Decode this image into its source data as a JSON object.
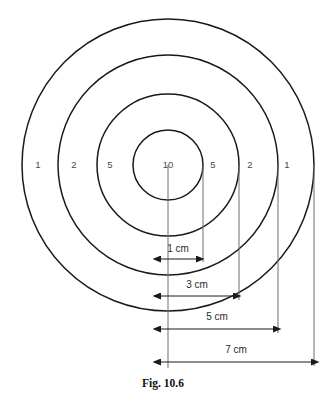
{
  "figure": {
    "caption": "Fig. 10.6",
    "kind": "concentric-circle-target-diagram",
    "center": {
      "x": 168,
      "y": 165
    },
    "rings": [
      {
        "score": "1",
        "radius_px": 146,
        "radius_cm": 7,
        "label_left_x": 38,
        "label_right_x": 287
      },
      {
        "score": "2",
        "radius_px": 110,
        "radius_cm": 5,
        "label_left_x": 74,
        "label_right_x": 250
      },
      {
        "score": "5",
        "radius_px": 71,
        "radius_cm": 3,
        "label_left_x": 110,
        "label_right_x": 213
      },
      {
        "score": "10",
        "radius_px": 35,
        "radius_cm": 1,
        "label_left_x": 168,
        "label_right_x": 168
      }
    ],
    "ring_label_y": 165,
    "ring_labels_left": [
      "1",
      "2",
      "5"
    ],
    "ring_labels_center": [
      "10"
    ],
    "ring_labels_right": [
      "5",
      "2",
      "1"
    ],
    "dimensions": [
      {
        "text": "1 cm",
        "from_x": 161,
        "to_x": 196,
        "y": 259,
        "label_x": 178,
        "label_y": 249
      },
      {
        "text": "3 cm",
        "from_x": 161,
        "to_x": 233,
        "y": 296,
        "label_x": 197,
        "label_y": 285
      },
      {
        "text": "5 cm",
        "from_x": 161,
        "to_x": 273,
        "y": 329,
        "label_x": 217,
        "label_y": 317
      },
      {
        "text": "7 cm",
        "from_x": 161,
        "to_x": 311,
        "y": 362,
        "label_x": 236,
        "label_y": 350
      }
    ],
    "extension_lines": [
      {
        "x": 168,
        "from_y": 165,
        "to_y": 368
      },
      {
        "x": 203,
        "from_y": 165,
        "to_y": 262
      },
      {
        "x": 239,
        "from_y": 165,
        "to_y": 300
      },
      {
        "x": 278,
        "from_y": 165,
        "to_y": 333
      },
      {
        "x": 314,
        "from_y": 165,
        "to_y": 366
      }
    ],
    "colors": {
      "ring_stroke": "#1a1a1a",
      "ring_label_text": "#4a4a4a",
      "extension_line": "#6f6f6f",
      "dimension_line": "#1a1a1a",
      "dimension_text": "#2b2b2b",
      "caption_text": "#111111",
      "background": "#ffffff"
    },
    "caption_position": {
      "x": 163,
      "y": 384
    }
  }
}
